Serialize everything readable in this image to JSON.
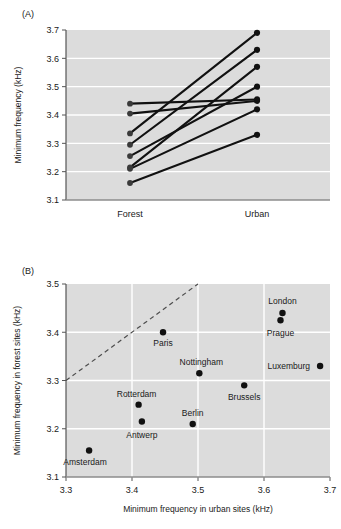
{
  "figure": {
    "panel_a_label": "(A)",
    "panel_b_label": "(B)"
  },
  "chart_data": [
    {
      "id": "panel_a",
      "type": "line",
      "title": "",
      "subtitle": "",
      "panel_label": "(A)",
      "xlabel": "",
      "ylabel": "Minimum frequency (kHz)",
      "categories": [
        "Forest",
        "Urban"
      ],
      "xtick_labels": [
        "Forest",
        "Urban"
      ],
      "ytick_labels": [
        "3.1",
        "3.2",
        "3.3",
        "3.4",
        "3.5",
        "3.6",
        "3.7"
      ],
      "ytick_values": [
        3.1,
        3.2,
        3.3,
        3.4,
        3.5,
        3.6,
        3.7
      ],
      "ylim": [
        3.1,
        3.7
      ],
      "grid": true,
      "grid_color": "#ffffff",
      "plot_bg": "#dcdcdc",
      "marker_color": "#111111",
      "line_color": "#111111",
      "legend": "none",
      "series": [
        {
          "name": "pair-1",
          "values": [
            3.44,
            3.455
          ]
        },
        {
          "name": "pair-2",
          "values": [
            3.405,
            3.45
          ]
        },
        {
          "name": "pair-3",
          "values": [
            3.335,
            3.69
          ]
        },
        {
          "name": "pair-4",
          "values": [
            3.295,
            3.63
          ]
        },
        {
          "name": "pair-5",
          "values": [
            3.255,
            3.5
          ]
        },
        {
          "name": "pair-6",
          "values": [
            3.215,
            3.57
          ]
        },
        {
          "name": "pair-7",
          "values": [
            3.21,
            3.42
          ]
        },
        {
          "name": "pair-8",
          "values": [
            3.16,
            3.33
          ]
        }
      ],
      "forest_values": [
        3.44,
        3.405,
        3.335,
        3.295,
        3.255,
        3.215,
        3.21,
        3.16
      ],
      "urban_values": [
        3.69,
        3.63,
        3.57,
        3.5,
        3.455,
        3.45,
        3.42,
        3.33
      ]
    },
    {
      "id": "panel_b",
      "type": "scatter",
      "title": "",
      "subtitle": "",
      "panel_label": "(B)",
      "xlabel": "Minimum frequency in urban sites (kHz)",
      "ylabel": "Minimum frequency in forest sites (kHz)",
      "xtick_labels": [
        "3.3",
        "3.4",
        "3.5",
        "3.6",
        "3.7"
      ],
      "xtick_values": [
        3.3,
        3.4,
        3.5,
        3.6,
        3.7
      ],
      "ytick_labels": [
        "3.1",
        "3.2",
        "3.3",
        "3.4",
        "3.5"
      ],
      "ytick_values": [
        3.1,
        3.2,
        3.3,
        3.4,
        3.5
      ],
      "xlim": [
        3.3,
        3.7
      ],
      "ylim": [
        3.1,
        3.5
      ],
      "grid": true,
      "grid_color": "#ffffff",
      "plot_bg": "#dcdcdc",
      "marker_color": "#111111",
      "legend": "none",
      "reference_line": {
        "name": "identity-line",
        "style": "dashed",
        "color": "#4d4d4d",
        "x": [
          3.3,
          3.5
        ],
        "y": [
          3.3,
          3.5
        ]
      },
      "points": [
        {
          "label": "Amsterdam",
          "x": 3.335,
          "y": 3.155,
          "label_dx": -4,
          "label_dy": 15,
          "anchor": "middle"
        },
        {
          "label": "Antwerp",
          "x": 3.415,
          "y": 3.215,
          "label_dx": 0,
          "label_dy": 16,
          "anchor": "middle"
        },
        {
          "label": "Rotterdam",
          "x": 3.41,
          "y": 3.25,
          "label_dx": -2,
          "label_dy": -8,
          "anchor": "middle"
        },
        {
          "label": "Berlin",
          "x": 3.492,
          "y": 3.21,
          "label_dx": 0,
          "label_dy": -8,
          "anchor": "middle"
        },
        {
          "label": "Paris",
          "x": 3.447,
          "y": 3.4,
          "label_dx": 0,
          "label_dy": 14,
          "anchor": "middle"
        },
        {
          "label": "Nottingham",
          "x": 3.502,
          "y": 3.315,
          "label_dx": 2,
          "label_dy": -8,
          "anchor": "middle"
        },
        {
          "label": "Brussels",
          "x": 3.57,
          "y": 3.29,
          "label_dx": 0,
          "label_dy": 15,
          "anchor": "middle"
        },
        {
          "label": "Prague",
          "x": 3.625,
          "y": 3.425,
          "label_dx": 0,
          "label_dy": 16,
          "anchor": "middle"
        },
        {
          "label": "London",
          "x": 3.628,
          "y": 3.44,
          "label_dx": 0,
          "label_dy": -9,
          "anchor": "middle"
        },
        {
          "label": "Luxemburg",
          "x": 3.685,
          "y": 3.33,
          "label_dx": -10,
          "label_dy": 3,
          "anchor": "end"
        }
      ]
    }
  ]
}
